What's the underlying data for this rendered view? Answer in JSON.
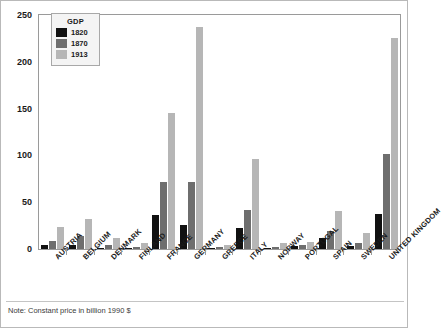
{
  "footnote": "Note: Constant price in billion 1990 $",
  "legend": {
    "title": "GDP",
    "entries": [
      {
        "label": "1820",
        "color": "#111111"
      },
      {
        "label": "1870",
        "color": "#6e6e6e"
      },
      {
        "label": "1913",
        "color": "#b6b6b6"
      }
    ]
  },
  "chart_data": {
    "type": "bar",
    "title": "",
    "subtitle": "",
    "xlabel": "",
    "ylabel": "",
    "ylim": [
      0,
      250
    ],
    "yticks": [
      0,
      50,
      100,
      150,
      200,
      250
    ],
    "grid": false,
    "legend_position": "top-left",
    "note": "Note: Constant price in billion 1990 $",
    "units": "billion 1990 US$",
    "categories": [
      "AUSTRIA",
      "BELGIUM",
      "DENMARK",
      "FINLAND",
      "FRANCE",
      "GERMANY",
      "GREECE",
      "ITALY",
      "NORWAY",
      "PORTUGAL",
      "SPAIN",
      "SWEDEN",
      "UNITED KINGDOM"
    ],
    "series": [
      {
        "name": "1820",
        "color": "#111111",
        "values": [
          4,
          4,
          1.5,
          1.3,
          36,
          26,
          1,
          22,
          1,
          3,
          12,
          3,
          37
        ]
      },
      {
        "name": "1870",
        "color": "#6e6e6e",
        "values": [
          8.4,
          13.7,
          3.8,
          2,
          72,
          72,
          2,
          42,
          2.5,
          4,
          19,
          6,
          101
        ]
      },
      {
        "name": "1913",
        "color": "#b6b6b6",
        "values": [
          24,
          32,
          11.7,
          6.6,
          145,
          237,
          4.5,
          96,
          6.5,
          7.5,
          41,
          17,
          225
        ]
      }
    ]
  }
}
